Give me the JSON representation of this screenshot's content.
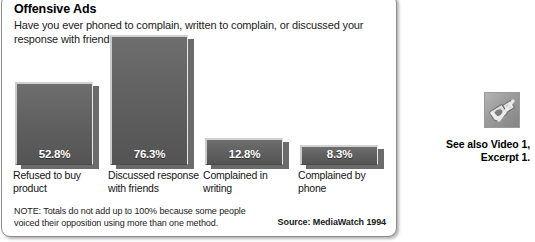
{
  "panel": {
    "title": "Offensive Ads",
    "question": "Have you ever phoned to complain, written to complain, or discussed your response with friends?",
    "note": "NOTE: Totals do not add up to 100% because some people voiced their opposition using more than one method.",
    "source": "Source: MediaWatch 1994"
  },
  "see_also": {
    "icon": "video-clip-icon",
    "label": "See also Video 1,\nExcerpt 1."
  },
  "chart_data": {
    "type": "bar",
    "title": "Offensive Ads",
    "subtitle": "Have you ever phoned to complain, written to complain, or discussed your response with friends?",
    "xlabel": "",
    "ylabel": "",
    "ylim": [
      0,
      100
    ],
    "grid": false,
    "legend": "none",
    "categories": [
      "Refused to buy\nproduct",
      "Discussed response\nwith friends",
      "Complained in\nwriting",
      "Complained by\nphone"
    ],
    "values": [
      52.8,
      76.3,
      12.8,
      8.3
    ],
    "value_labels": [
      "52.8%",
      "76.3%",
      "12.8%",
      "8.3%"
    ],
    "bar_color": "#5f5f5f",
    "shadow_color": "#6b6b6b",
    "value_text_color": "#ffffff",
    "source": "Source: MediaWatch 1994"
  }
}
